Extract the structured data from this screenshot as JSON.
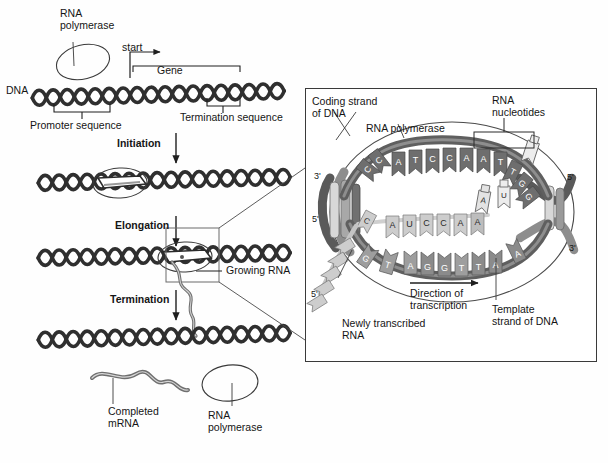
{
  "figure": {
    "background": "#fefefe"
  },
  "left_panel": {
    "labels": {
      "rna_polymerase_top": "RNA\npolymerase",
      "start": "start",
      "gene": "Gene",
      "dna": "DNA",
      "promoter_sequence": "Promoter sequence",
      "termination_sequence": "Termination sequence",
      "growing_rna": "Growing RNA",
      "completed_mrna": "Completed\nmRNA",
      "rna_polymerase_bottom": "RNA\npolymerase"
    },
    "steps": [
      {
        "name": "initiation",
        "label": "Initiation"
      },
      {
        "name": "elongation",
        "label": "Elongation"
      },
      {
        "name": "termination",
        "label": "Termination"
      }
    ]
  },
  "inset_panel": {
    "labels": {
      "coding_strand": "Coding strand\nof DNA",
      "rna_polymerase": "RNA polymerase",
      "rna_nucleotides": "RNA\nnucleotides",
      "direction_of_transcription": "Direction of\ntranscription",
      "template_strand": "Template\nstrand of DNA",
      "newly_transcribed_rna": "Newly transcribed\nRNA"
    },
    "end_labels": {
      "left_top": "3'",
      "left_bottom": "5'",
      "right_top": "5'",
      "right_bottom": "3'"
    },
    "sequences": {
      "coding_strand_of_dna": [
        "C",
        "C",
        "A",
        "T",
        "C",
        "C",
        "A",
        "A",
        "T",
        "T",
        "G",
        "G"
      ],
      "template_strand_of_dna": [
        "G",
        "T",
        "A",
        "G",
        "G",
        "T",
        "T",
        "A",
        "A"
      ],
      "newly_transcribed_rna": [
        "C",
        "A",
        "U",
        "C",
        "C",
        "A",
        "A"
      ],
      "free_nucleotides": [
        "A",
        "U"
      ]
    }
  },
  "colors": {
    "dna_dark": "#4a4a4a",
    "dna_outline": "#2b2b2b",
    "base_dark": "#6e6e6e",
    "base_light": "#c9c9c9",
    "rna_light": "#b8b8b8",
    "line": "#2b2b2b",
    "text": "#151515",
    "inset_border": "#3a3a3a"
  }
}
